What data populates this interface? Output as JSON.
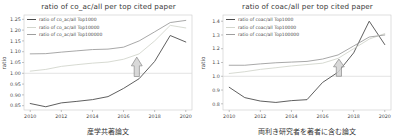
{
  "figure": {
    "ylabel": "ratio",
    "accent_colors": {
      "dark_series": "#4d4d4d",
      "pale_series": "#d3d6cd",
      "gray_series": "#9e9e9e",
      "reference_line": "#dcdcdc",
      "spine": "#c9c9c9",
      "arrow_fill": "#d2d2d2",
      "arrow_outline": "#8a8a8a"
    }
  },
  "chart_data": [
    {
      "type": "line",
      "title": "ratio of co_ac/all per top cited paper",
      "xlabel": "産学共著論文",
      "ylabel": "ratio",
      "legend_position": "upper left",
      "grid": false,
      "x": [
        2010,
        2011,
        2012,
        2013,
        2014,
        2015,
        2016,
        2017,
        2018,
        2019,
        2020
      ],
      "xlim": [
        2009.6,
        2020.4
      ],
      "ylim": [
        0.83,
        1.27
      ],
      "xtick_labels": [
        "2010",
        "2012",
        "2014",
        "2016",
        "2018",
        "2020"
      ],
      "ytick_labels": [
        "0.85",
        "0.90",
        "0.95",
        "1.00",
        "1.05",
        "1.10",
        "1.15",
        "1.20",
        "1.25"
      ],
      "ref_line": 1.0,
      "annotation": {
        "shape": "up-arrow",
        "x": 2016.85,
        "y_base": 0.985,
        "y_tip": 1.075
      },
      "series": [
        {
          "name": "ratio of co_ac/all Top1000",
          "color": "#4d4d4d",
          "values": [
            0.86,
            0.845,
            0.863,
            0.87,
            0.878,
            0.892,
            0.93,
            0.975,
            1.055,
            1.175,
            1.145
          ]
        },
        {
          "name": "ratio of co_ac/all Top10000",
          "color": "#d3d6cd",
          "values": [
            1.01,
            1.018,
            1.032,
            1.04,
            1.047,
            1.052,
            1.065,
            1.09,
            1.15,
            1.222,
            1.21
          ]
        },
        {
          "name": "ratio of co_ac/all Top100000",
          "color": "#9e9e9e",
          "values": [
            1.09,
            1.091,
            1.098,
            1.104,
            1.11,
            1.112,
            1.121,
            1.15,
            1.192,
            1.235,
            1.245
          ]
        }
      ]
    },
    {
      "type": "line",
      "title": "ratio of coac/all per top cited paper",
      "xlabel": "両利き研究者を著者に含む論文",
      "ylabel": "ratio",
      "legend_position": "upper left",
      "grid": false,
      "x": [
        2010,
        2011,
        2012,
        2013,
        2014,
        2015,
        2016,
        2017,
        2018,
        2019,
        2020
      ],
      "xlim": [
        2009.6,
        2020.4
      ],
      "ylim": [
        0.755,
        1.445
      ],
      "xtick_labels": [
        "2010",
        "2012",
        "2014",
        "2016",
        "2018",
        "2020"
      ],
      "ytick_labels": [
        "0.8",
        "0.9",
        "1.0",
        "1.1",
        "1.2",
        "1.3",
        "1.4"
      ],
      "ref_line": 1.0,
      "annotation": {
        "shape": "up-arrow",
        "x": 2017.05,
        "y_base": 1.0,
        "y_tip": 1.125
      },
      "series": [
        {
          "name": "ratio of coac/all Top1000",
          "color": "#4d4d4d",
          "values": [
            0.92,
            0.845,
            0.82,
            0.81,
            0.823,
            0.83,
            0.955,
            1.03,
            1.17,
            1.4,
            1.23
          ]
        },
        {
          "name": "ratio of coac/all Top10000",
          "color": "#d3d6cd",
          "values": [
            1.02,
            1.033,
            1.05,
            1.062,
            1.075,
            1.085,
            1.095,
            1.13,
            1.2,
            1.27,
            1.31
          ]
        },
        {
          "name": "ratio of coac/all Top100000",
          "color": "#9e9e9e",
          "values": [
            1.08,
            1.08,
            1.09,
            1.098,
            1.103,
            1.108,
            1.125,
            1.155,
            1.22,
            1.285,
            1.3
          ]
        }
      ]
    }
  ]
}
